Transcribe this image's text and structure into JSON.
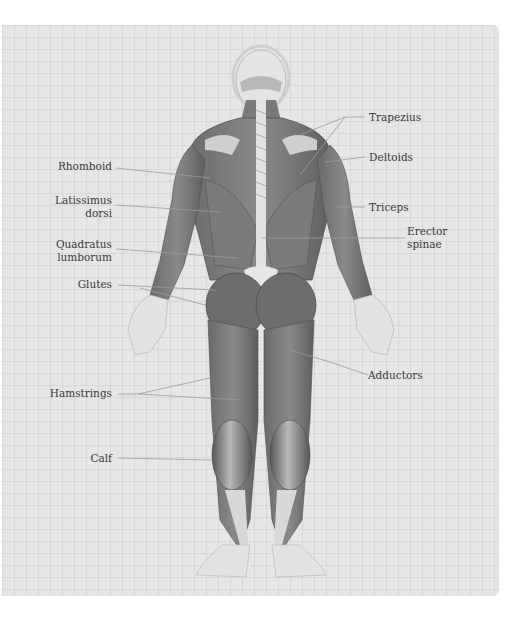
{
  "diagram": {
    "style": "grayscale",
    "colors": {
      "panel_background": "#e6e6e6",
      "muscle_dark": "#5a5a5a",
      "muscle_mid": "#7d7d7d",
      "muscle_light": "#a8a8a8",
      "skin": "#dcdcdc",
      "tendon": "#ededed",
      "label_text": "#3a3a3a",
      "leader_line": "#9a9a9a"
    },
    "labels_left": [
      {
        "id": "rhomboid",
        "text": "Rhomboid"
      },
      {
        "id": "latissimus",
        "text": "Latissimus\ndorsi"
      },
      {
        "id": "quadratus",
        "text": "Quadratus\nlumborum"
      },
      {
        "id": "glutes",
        "text": "Glutes"
      },
      {
        "id": "hamstrings",
        "text": "Hamstrings"
      },
      {
        "id": "calf",
        "text": "Calf"
      }
    ],
    "labels_right": [
      {
        "id": "trapezius",
        "text": "Trapezius"
      },
      {
        "id": "deltoids",
        "text": "Deltoids"
      },
      {
        "id": "triceps",
        "text": "Triceps"
      },
      {
        "id": "erector",
        "text": "Erector\nspinae"
      },
      {
        "id": "adductors",
        "text": "Adductors"
      }
    ]
  }
}
